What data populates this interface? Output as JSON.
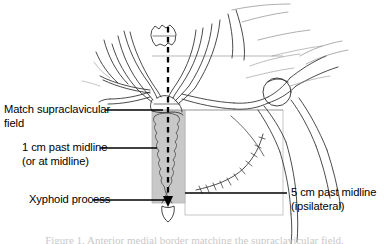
{
  "figure": {
    "caption": "Figure 1. Anterior medial border matching the supraclavicular field."
  },
  "colors": {
    "ink": "#1a1a1a",
    "field_fill": "#c8c8c8",
    "field_border": "#b0b0b0",
    "leader": "#000000",
    "caption": "#c9c9c9",
    "background": "#ffffff"
  },
  "annotations": [
    {
      "id": "match-supraclavicular-field",
      "line1": "Match supraclavicular",
      "line2": "field",
      "leader": "solid"
    },
    {
      "id": "one-cm-past-midline",
      "line1": "1 cm past midline",
      "line2": "(or at midline)",
      "leader": "solid"
    },
    {
      "id": "xyphoid-process",
      "line1": "Xyphoid process",
      "line2": "",
      "leader": "solid"
    },
    {
      "id": "five-cm-past-midline",
      "line1": "5 cm past midline",
      "line2": "(ipsilateral)",
      "leader": "solid"
    }
  ],
  "elements": {
    "midline_label": "midline-dashed-axis",
    "medial_field_label": "medial-tangent-field",
    "lateral_field_label": "lateral-tangent-field",
    "scar_label": "surgical-scar-suture-line",
    "xyphoid_label": "xyphoid-process-marker"
  }
}
